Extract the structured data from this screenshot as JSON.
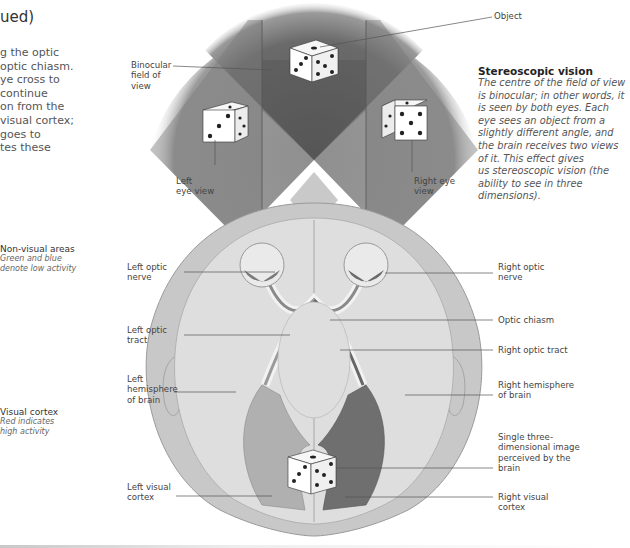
{
  "header": {
    "title_fragment": "ued)",
    "intro_text": "g the optic\noptic chiasm.\nye cross to\n continue\non from the\nvisual cortex;\ngoes to\ntes these"
  },
  "legend": {
    "non_visual": {
      "title": "Non-visual areas",
      "description": "Green and blue\ndenote low activity"
    },
    "visual": {
      "title": "Visual cortex",
      "description": "Red indicates\nhigh activity"
    }
  },
  "sidebar": {
    "title": "Stereoscopic vision",
    "body": "The centre of the field of view\nis binocular; in other words, it\nis seen by both eyes. Each\neye sees an object from a\nslightly different angle, and\nthe brain receives two views\nof it. This effect gives\nus stereoscopic vision (the\nability to see in three\ndimensions)."
  },
  "labels": {
    "object": "Object",
    "binocular": "Binocular\nfield of\nview",
    "left_eye_view": "Left\neye view",
    "right_eye_view": "Right eye\nview",
    "left_optic_nerve": "Left optic\nnerve",
    "left_optic_tract": "Left optic\ntract",
    "left_hemisphere": "Left\nhemisphere\nof brain",
    "left_visual_cortex": "Left visual\ncortex",
    "right_optic_nerve": "Right optic\nnerve",
    "optic_chiasm": "Optic chiasm",
    "right_optic_tract": "Right optic tract",
    "right_hemisphere": "Right hemisphere\nof brain",
    "single_image": "Single three-\ndimensional image\nperceived by the\nbrain",
    "right_visual_cortex": "Right visual\ncortex"
  },
  "colors": {
    "field_dark": "#5a5a5a",
    "field_mid": "#8c8c8c",
    "field_light": "#b4b4b4",
    "skull": "#c9c9c9",
    "brain": "#dcdcdc",
    "cortex_left": "#a8a8a8",
    "cortex_right": "#6e6e6e"
  }
}
